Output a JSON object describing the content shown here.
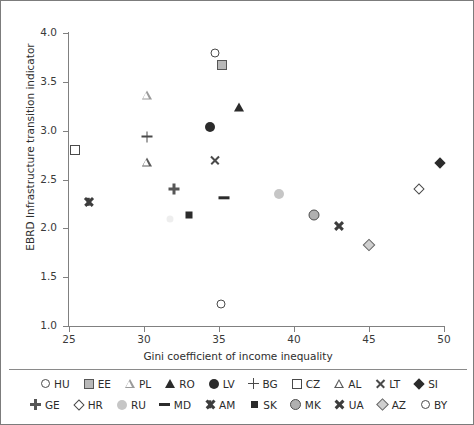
{
  "chart_data": {
    "type": "scatter",
    "title": "",
    "xlabel": "Gini coefficient of income inequality",
    "ylabel": "EBRD Infrastructure transition indicator",
    "xlim": [
      25,
      50
    ],
    "ylim": [
      1.0,
      4.0
    ],
    "xticks": [
      "25",
      "30",
      "35",
      "40",
      "45",
      "50"
    ],
    "yticks": [
      "4.0",
      "3.5",
      "3.0",
      "2.5",
      "2.0",
      "1.5",
      "1.0"
    ],
    "grid": false,
    "legend_position": "bottom",
    "points": [
      {
        "code": "HU",
        "x": 34.7,
        "y": 3.8,
        "symbol": "circle-open"
      },
      {
        "code": "EE",
        "x": 35.2,
        "y": 3.67,
        "symbol": "square-gray"
      },
      {
        "code": "PL",
        "x": 30.2,
        "y": 3.37,
        "symbol": "triangle-open-gray"
      },
      {
        "code": "RO",
        "x": 36.3,
        "y": 3.24,
        "symbol": "triangle-fill"
      },
      {
        "code": "LV",
        "x": 34.4,
        "y": 3.04,
        "symbol": "circle-fill"
      },
      {
        "code": "BG",
        "x": 30.2,
        "y": 2.94,
        "symbol": "plus"
      },
      {
        "code": "CZ",
        "x": 25.4,
        "y": 2.8,
        "symbol": "square-open"
      },
      {
        "code": "AL",
        "x": 30.2,
        "y": 2.68,
        "symbol": "triangle-open"
      },
      {
        "code": "LT",
        "x": 34.7,
        "y": 2.7,
        "symbol": "x-mark"
      },
      {
        "code": "SI",
        "x": 49.7,
        "y": 2.67,
        "symbol": "diamond-fill"
      },
      {
        "code": "GE",
        "x": 32.0,
        "y": 2.4,
        "symbol": "plus-box"
      },
      {
        "code": "HR",
        "x": 48.3,
        "y": 2.4,
        "symbol": "diamond-open"
      },
      {
        "code": "RU",
        "x": 39.0,
        "y": 2.35,
        "symbol": "circle-lightgray"
      },
      {
        "code": "MD",
        "x": 35.3,
        "y": 2.31,
        "symbol": "dash"
      },
      {
        "code": "AM",
        "x": 26.3,
        "y": 2.27,
        "symbol": "asterisk"
      },
      {
        "code": "SK",
        "x": 33.0,
        "y": 2.14,
        "symbol": "square-fill"
      },
      {
        "code": "MK",
        "x": 41.3,
        "y": 2.14,
        "symbol": "circle-gray-outline"
      },
      {
        "code": "UA",
        "x": 43.0,
        "y": 2.03,
        "symbol": "x-bold"
      },
      {
        "code": "AZ",
        "x": 45.0,
        "y": 1.83,
        "symbol": "diamond-gray"
      },
      {
        "code": "BY",
        "x": 35.1,
        "y": 1.23,
        "symbol": "circle-open"
      },
      {
        "code": "",
        "x": 31.7,
        "y": 2.1,
        "symbol": "faint-gray"
      }
    ],
    "legend_rows": [
      [
        {
          "code": "HU",
          "symbol": "circle-open"
        },
        {
          "code": "EE",
          "symbol": "square-gray"
        },
        {
          "code": "PL",
          "symbol": "triangle-open-gray"
        },
        {
          "code": "RO",
          "symbol": "triangle-fill"
        },
        {
          "code": "LV",
          "symbol": "circle-fill"
        },
        {
          "code": "BG",
          "symbol": "plus"
        },
        {
          "code": "CZ",
          "symbol": "square-open"
        },
        {
          "code": "AL",
          "symbol": "triangle-open"
        },
        {
          "code": "LT",
          "symbol": "x-mark"
        },
        {
          "code": "SI",
          "symbol": "diamond-fill"
        }
      ],
      [
        {
          "code": "GE",
          "symbol": "plus-box"
        },
        {
          "code": "HR",
          "symbol": "diamond-open"
        },
        {
          "code": "RU",
          "symbol": "circle-lightgray"
        },
        {
          "code": "MD",
          "symbol": "dash"
        },
        {
          "code": "AM",
          "symbol": "asterisk"
        },
        {
          "code": "SK",
          "symbol": "square-fill"
        },
        {
          "code": "MK",
          "symbol": "circle-gray-outline"
        },
        {
          "code": "UA",
          "symbol": "x-bold"
        },
        {
          "code": "AZ",
          "symbol": "diamond-gray"
        },
        {
          "code": "BY",
          "symbol": "circle-open"
        }
      ]
    ]
  },
  "colors": {
    "axis": "#808080",
    "text": "#2b2b2b",
    "marker_dark": "#2b2b2b",
    "marker_gray": "#b0b0b0",
    "marker_lightgray": "#c6c6c6",
    "border": "#7c7c7c"
  }
}
